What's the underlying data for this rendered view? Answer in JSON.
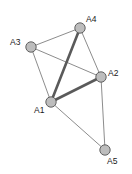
{
  "figure": {
    "type": "node-link-graph",
    "width": 132,
    "height": 174,
    "background": "#ffffff"
  },
  "style": {
    "node_fill": "#bdbdbd",
    "node_stroke": "#555555",
    "node_radius": 5.2,
    "node_stroke_width": 0.9,
    "edge_color": "#6e6e6e",
    "edge_thin_width": 0.8,
    "edge_bold_color": "#5a5a5a",
    "edge_bold_width": 2.6,
    "label_color": "#1a1a1a",
    "label_font_size": 8.5
  },
  "nodes": [
    {
      "id": "A1",
      "label": "A1",
      "x": 51,
      "y": 102,
      "label_x": 34,
      "label_y": 113,
      "label_anchor": "start"
    },
    {
      "id": "A2",
      "label": "A2",
      "x": 101,
      "y": 77,
      "label_x": 108,
      "label_y": 76,
      "label_anchor": "start"
    },
    {
      "id": "A3",
      "label": "A3",
      "x": 31,
      "y": 47,
      "label_x": 10,
      "label_y": 45,
      "label_anchor": "start"
    },
    {
      "id": "A4",
      "label": "A4",
      "x": 80,
      "y": 28,
      "label_x": 86,
      "label_y": 22,
      "label_anchor": "start"
    },
    {
      "id": "A5",
      "label": "A5",
      "x": 105,
      "y": 150,
      "label_x": 107,
      "label_y": 164,
      "label_anchor": "start"
    }
  ],
  "edges": [
    {
      "id": "A3-A4",
      "source": "A3",
      "target": "A4",
      "weight": "thin",
      "x1": 31,
      "y1": 47,
      "x2": 80,
      "y2": 28
    },
    {
      "id": "A3-A1",
      "source": "A3",
      "target": "A1",
      "weight": "thin",
      "x1": 31,
      "y1": 47,
      "x2": 51,
      "y2": 102
    },
    {
      "id": "A3-A2",
      "source": "A3",
      "target": "A2",
      "weight": "thin",
      "x1": 31,
      "y1": 47,
      "x2": 101,
      "y2": 77
    },
    {
      "id": "A4-A2",
      "source": "A4",
      "target": "A2",
      "weight": "thin",
      "x1": 80,
      "y1": 28,
      "x2": 101,
      "y2": 77
    },
    {
      "id": "A1-A5",
      "source": "A1",
      "target": "A5",
      "weight": "thin",
      "x1": 51,
      "y1": 102,
      "x2": 105,
      "y2": 150
    },
    {
      "id": "A2-A5",
      "source": "A2",
      "target": "A5",
      "weight": "thin",
      "x1": 101,
      "y1": 77,
      "x2": 105,
      "y2": 150
    },
    {
      "id": "A1-A4",
      "source": "A1",
      "target": "A4",
      "weight": "bold",
      "x1": 51,
      "y1": 102,
      "x2": 80,
      "y2": 28
    },
    {
      "id": "A1-A2",
      "source": "A1",
      "target": "A2",
      "weight": "bold",
      "x1": 51,
      "y1": 102,
      "x2": 101,
      "y2": 77
    }
  ]
}
